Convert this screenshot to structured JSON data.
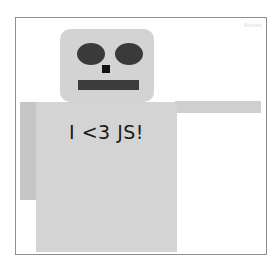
{
  "canvas": {
    "restart_label": "Restart"
  },
  "robot": {
    "shirt_text": "I <3 JS!",
    "colors": {
      "head": "#d3d3d3",
      "body": "#d4d4d4",
      "left_arm": "#c6c6c6",
      "right_arm": "#cfcfcf",
      "eyes": "#3a3a3a",
      "nose": "#111111",
      "mouth": "#3c3c3c"
    },
    "icons": {
      "head": "rounded-rect",
      "eye": "ellipse",
      "nose": "square",
      "mouth": "bar"
    }
  }
}
